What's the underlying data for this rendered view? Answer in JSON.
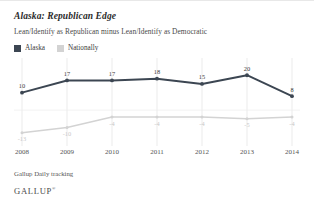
{
  "header": {
    "title": "Alaska: Republican Edge",
    "subtitle": "Lean/Identify as Republican minus Lean/Identify as Democratic"
  },
  "legend": {
    "items": [
      {
        "label": "Alaska",
        "color": "#3c4652"
      },
      {
        "label": "Nationally",
        "color": "#d3d3d3"
      }
    ]
  },
  "footer": {
    "source": "Gallup Daily tracking",
    "brand": "GALLUP",
    "brand_mark": "®"
  },
  "chart_data": {
    "type": "line",
    "title": "Alaska: Republican Edge",
    "subtitle": "Lean/Identify as Republican minus Lean/Identify as Democratic",
    "xlabel": "",
    "ylabel": "",
    "categories": [
      "2008",
      "2009",
      "2010",
      "2011",
      "2012",
      "2013",
      "2014"
    ],
    "x": [
      2008,
      2009,
      2010,
      2011,
      2012,
      2013,
      2014
    ],
    "series": [
      {
        "name": "Alaska",
        "color": "#3c4652",
        "values": [
          10,
          17,
          17,
          18,
          15,
          20,
          8
        ],
        "labels": [
          "10",
          "17",
          "17",
          "18",
          "15",
          "20",
          "8"
        ]
      },
      {
        "name": "Nationally",
        "color": "#d3d3d3",
        "values": [
          -13,
          -10,
          -4,
          -4,
          -4,
          -5,
          -4
        ],
        "labels": [
          "-13",
          "-10",
          "-4",
          "-4",
          "-4",
          "-5",
          "-4"
        ]
      }
    ],
    "ylim": [
      -16,
      23
    ],
    "grid": "vertical",
    "zero_line": true,
    "legend_position": "top-left"
  }
}
